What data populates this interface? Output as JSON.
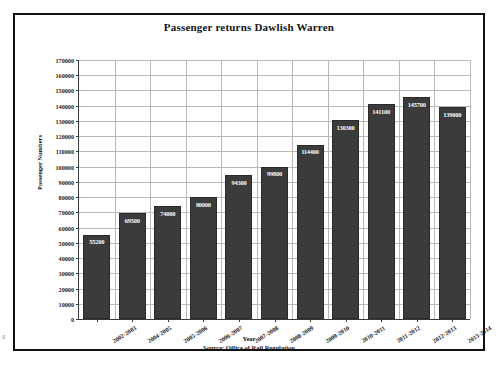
{
  "page": {
    "scan_artifact": "s"
  },
  "chart_data": {
    "type": "bar",
    "title": "Passenger returns Dawlish Warren",
    "xlabel": "Year",
    "ylabel": "Passenger Numbers",
    "source_note": "Source: Office of Rail Regulation",
    "categories": [
      "2002-2003",
      "2004-2005",
      "2005-2006",
      "2006-2007",
      "2007-2008",
      "2008-2009",
      "2009-2010",
      "2010-2011",
      "2011-2012",
      "2012-2013",
      "2013-2014"
    ],
    "values": [
      55200,
      69500,
      74000,
      80000,
      94300,
      99800,
      114400,
      130300,
      141100,
      145700,
      139000
    ],
    "value_labels": [
      "55200",
      "69500",
      "74000",
      "80000",
      "94300",
      "99800",
      "114400",
      "130300",
      "141100",
      "145700",
      "139000"
    ],
    "ylim": [
      0,
      170000
    ],
    "ytick_step": 10000,
    "ytick_labels": [
      "0",
      "10000",
      "20000",
      "30000",
      "40000",
      "50000",
      "60000",
      "70000",
      "80000",
      "90000",
      "100000",
      "110000",
      "120000",
      "130000",
      "140000",
      "150000",
      "160000",
      "170000"
    ],
    "grid": true,
    "legend": false,
    "bar_color": "#3b3b3b",
    "grid_color": "#b9b9b9",
    "axis_color": "#3a3a3a",
    "label_text_color": "#ffffff"
  }
}
